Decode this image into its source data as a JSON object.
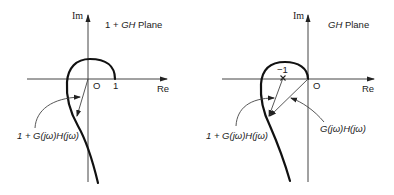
{
  "left_panel": {
    "plane_title_prefix": "1 + ",
    "plane_title_italic": "GH",
    "plane_title_suffix": " Plane",
    "im_label": "Im",
    "re_label": "Re",
    "origin_label": "O",
    "one_label": "1",
    "vector_label": "1 + G(jω)H(jω)"
  },
  "right_panel": {
    "plane_title_italic": "GH",
    "plane_title_suffix": " Plane",
    "im_label": "Im",
    "re_label": "Re",
    "origin_label": "O",
    "minus_one_label": "−1",
    "vector_label_1": "1 + G(jω)H(jω)",
    "vector_label_2": "G(jω)H(jω)"
  }
}
